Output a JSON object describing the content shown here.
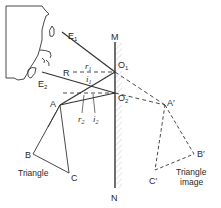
{
  "diagram": {
    "type": "plane-mirror-reflection",
    "mirror": {
      "top_label": "M",
      "bottom_label": "N"
    },
    "points": {
      "E1": "E",
      "E1_sub": "1",
      "E2": "E",
      "E2_sub": "2",
      "O1": "O",
      "O1_sub": "1",
      "O2": "O",
      "O2_sub": "2",
      "R": "R",
      "A": "A",
      "B": "B",
      "C": "C",
      "A_img": "A′",
      "B_img": "B′",
      "C_img": "C′"
    },
    "angles": {
      "r1": "r",
      "r1_sub": "1",
      "i1": "i",
      "i1_sub": "1",
      "r2": "r",
      "r2_sub": "2",
      "i2": "i",
      "i2_sub": "2"
    },
    "captions": {
      "object": "Triangle",
      "image_line1": "Triangle",
      "image_line2": "image"
    },
    "colors": {
      "ink": "#2a2a2a",
      "mirror_hatch": "#c8c8c8",
      "background": "#ffffff"
    }
  }
}
